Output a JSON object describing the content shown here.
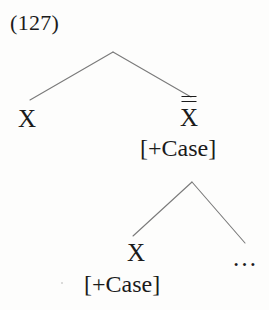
{
  "figure": {
    "example_number": "(127)",
    "type": "x-bar syntactic tree",
    "background_color": "#fdfdfc",
    "line_color": "#7a7a7a",
    "text_color": "#1b1b1b"
  },
  "tree": {
    "root": {
      "label": "",
      "apex": {
        "x": 113,
        "y": 52
      }
    },
    "nodes": {
      "specifier": {
        "label": "X",
        "feature": "",
        "bars": 0
      },
      "maximal_projection": {
        "label": "X",
        "bars": 2,
        "bar_glyph": "double-overbar",
        "feature": "[+Case]"
      },
      "head": {
        "label": "X",
        "bars": 0,
        "feature": "[+Case]"
      },
      "complement": {
        "label": "…"
      }
    }
  },
  "branches": [
    {
      "name": "root-to-specifier",
      "x1": 113,
      "y1": 52,
      "x2": 30,
      "y2": 100
    },
    {
      "name": "root-to-maximal-projection",
      "x1": 113,
      "y1": 52,
      "x2": 191,
      "y2": 97
    },
    {
      "name": "maximal-projection-to-head",
      "x1": 192,
      "y1": 182,
      "x2": 133,
      "y2": 236
    },
    {
      "name": "maximal-projection-to-complement",
      "x1": 192,
      "y1": 182,
      "x2": 245,
      "y2": 243
    }
  ]
}
